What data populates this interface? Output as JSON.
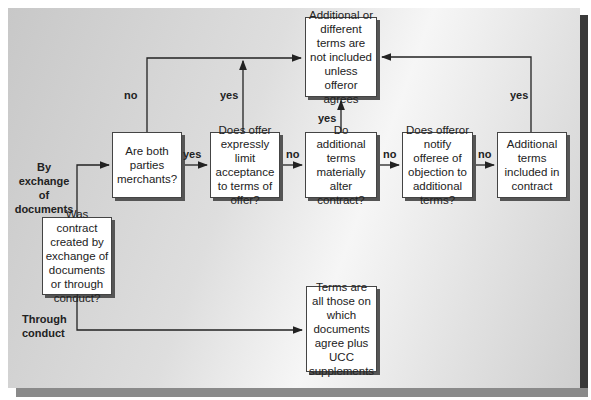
{
  "header": {
    "caption_cropped": "Inclusion and Exclusion of..."
  },
  "nodes": {
    "start": "Was contract created by exchange of documents or through conduct?",
    "merchants": "Are both parties merchants?",
    "limit": "Does offer expressly limit acceptance to terms of offer?",
    "alter": "Do additional terms materially alter contract?",
    "notify": "Does offeror notify offeree of objection to additional terms?",
    "included": "Additional terms included in contract",
    "not_included": "Additional or different terms are not included unless offeror agrees",
    "conduct_result": "Terms are all those on which documents agree plus UCC supplements"
  },
  "labels": {
    "by_exchange": "By exchange of documents",
    "through_conduct": "Through conduct",
    "merchants_no": "no",
    "merchants_yes": "yes",
    "limit_yes": "yes",
    "limit_no": "no",
    "alter_yes": "yes",
    "alter_no": "no",
    "notify_yes": "yes",
    "notify_no": "no"
  },
  "colors": {
    "line": "#222222",
    "box_border": "#444444",
    "shadow": "#555555"
  }
}
